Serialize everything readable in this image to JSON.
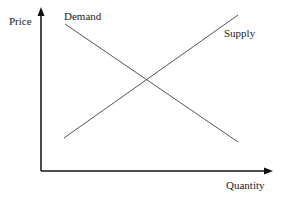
{
  "diagram": {
    "type": "supply-demand",
    "axes": {
      "y_label": "Price",
      "x_label": "Quantity"
    },
    "curves": [
      {
        "name": "Demand",
        "label": "Demand",
        "direction": "downward-sloping",
        "from": [
          65,
          24
        ],
        "to": [
          238,
          142
        ]
      },
      {
        "name": "Supply",
        "label": "Supply",
        "direction": "upward-sloping",
        "from": [
          64,
          138
        ],
        "to": [
          238,
          15
        ]
      }
    ],
    "colors": {
      "axis": "#111111",
      "curve": "#555555",
      "text": "#222222"
    }
  }
}
